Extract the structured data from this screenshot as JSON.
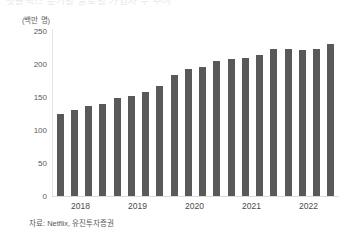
{
  "figure": {
    "clipped_title": "넷플릭스 분기별 글로벌 가입자 수 추이",
    "unit_label": "(백만 명)",
    "source_note": "자료: Netflix, 유진투자증권",
    "bar_color": "#595959",
    "axis_color": "#e3e3e3",
    "text_color": "#4a4a4a"
  },
  "chart_data": {
    "type": "bar",
    "title": "",
    "xlabel": "",
    "ylabel": "",
    "unit": "백만 명",
    "ylim": [
      0,
      250
    ],
    "yticks": [
      0,
      50,
      100,
      150,
      200,
      250
    ],
    "ytick_labels": [
      "0",
      "50",
      "100",
      "150",
      "200",
      "250"
    ],
    "grid": false,
    "legend": "none",
    "x_axis_group_labels": [
      "2018",
      "2019",
      "2020",
      "2021",
      "2022"
    ],
    "categories": [
      "2018 1Q",
      "2018 2Q",
      "2018 3Q",
      "2018 4Q",
      "2019 1Q",
      "2019 2Q",
      "2019 3Q",
      "2019 4Q",
      "2020 1Q",
      "2020 2Q",
      "2020 3Q",
      "2020 4Q",
      "2021 1Q",
      "2021 2Q",
      "2021 3Q",
      "2021 4Q",
      "2022 1Q",
      "2022 2Q",
      "2022 3Q",
      "2022 4Q"
    ],
    "values": [
      125,
      130,
      137,
      139,
      149,
      152,
      158,
      167,
      183,
      193,
      195,
      204,
      208,
      209,
      214,
      222,
      222,
      221,
      223,
      231
    ],
    "series": [
      {
        "name": "글로벌 유료 가입자",
        "values": [
          125,
          130,
          137,
          139,
          149,
          152,
          158,
          167,
          183,
          193,
          195,
          204,
          208,
          209,
          214,
          222,
          222,
          221,
          223,
          231
        ]
      }
    ]
  }
}
